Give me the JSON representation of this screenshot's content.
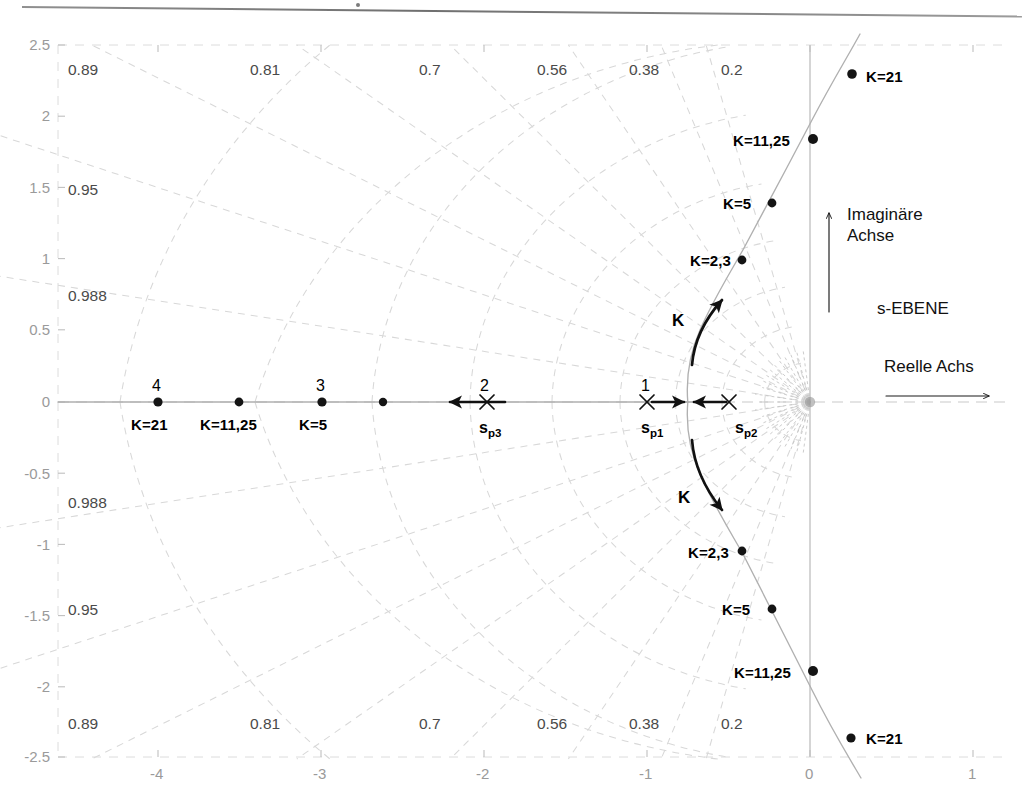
{
  "figure": {
    "title": "s-EBENE",
    "plane_label": "s-EBENE",
    "imag_axis_label_line1": "Imaginäre",
    "imag_axis_label_line2": "Achse",
    "real_axis_label": "Reelle Achs"
  },
  "axes": {
    "x_ticks": [
      "-4",
      "-3",
      "-2",
      "-1",
      "0",
      "1"
    ],
    "x_tick_values": [
      -4,
      -3,
      -2,
      -1,
      0,
      1
    ],
    "y_ticks": [
      "2.5",
      "2",
      "1.5",
      "1",
      "0.5",
      "0",
      "-0.5",
      "-1",
      "-1.5",
      "-2",
      "-2.5"
    ],
    "y_tick_values": [
      2.5,
      2,
      1.5,
      1,
      0.5,
      0,
      -0.5,
      -1,
      -1.5,
      -2,
      -2.5
    ],
    "xlim": [
      -4.85,
      1.3
    ],
    "ylim": [
      -2.5,
      2.5
    ],
    "grid": "damping-and-natural-frequency (zeta/wn polar grid, dashed)"
  },
  "damping_labels": {
    "top": [
      {
        "text": "0.89",
        "zeta": 0.89
      },
      {
        "text": "0.81",
        "zeta": 0.81
      },
      {
        "text": "0.7",
        "zeta": 0.7
      },
      {
        "text": "0.56",
        "zeta": 0.56
      },
      {
        "text": "0.38",
        "zeta": 0.38
      },
      {
        "text": "0.2",
        "zeta": 0.2
      }
    ],
    "bottom": [
      {
        "text": "0.89",
        "zeta": 0.89
      },
      {
        "text": "0.81",
        "zeta": 0.81
      },
      {
        "text": "0.7",
        "zeta": 0.7
      },
      {
        "text": "0.56",
        "zeta": 0.56
      },
      {
        "text": "0.38",
        "zeta": 0.38
      },
      {
        "text": "0.2",
        "zeta": 0.2
      }
    ],
    "left_upper": [
      {
        "text": "0.95",
        "zeta": 0.95
      },
      {
        "text": "0.988",
        "zeta": 0.988
      }
    ],
    "left_lower": [
      {
        "text": "0.988",
        "zeta": 0.988
      },
      {
        "text": "0.95",
        "zeta": 0.95
      }
    ],
    "left_top": [
      {
        "text": "0.89",
        "zeta": 0.89
      }
    ],
    "left_bottom": [
      {
        "text": "0.89",
        "zeta": 0.89
      }
    ]
  },
  "chart_data": {
    "type": "scatter",
    "title": "s-EBENE",
    "xlabel": "Reelle Achs",
    "ylabel": "Imaginäre Achse",
    "xlim": [
      -4.85,
      1.3
    ],
    "ylim": [
      -2.5,
      2.5
    ],
    "grid": true,
    "open_loop_poles": [
      {
        "name": "s_p1",
        "label": "s",
        "sub": "p1",
        "id": "1",
        "re": -1.0,
        "im": 0.0
      },
      {
        "name": "s_p2",
        "label": "s",
        "sub": "p2",
        "id": "",
        "re": -0.5,
        "im": 0.0
      },
      {
        "name": "s_p3",
        "label": "s",
        "sub": "p3",
        "id": "2",
        "re": -2.0,
        "im": 0.0
      }
    ],
    "breakaway_point": {
      "re": -0.75,
      "im": 0.0
    },
    "series": [
      {
        "name": "upper-complex-branch",
        "gain_markers": [
          {
            "K": "2,3",
            "re": -0.42,
            "im": 0.98
          },
          {
            "K": "5",
            "re": -0.24,
            "im": 1.38
          },
          {
            "K": "11,25",
            "re": 0.02,
            "im": 1.83
          },
          {
            "K": "21",
            "re": 0.26,
            "im": 2.3
          }
        ]
      },
      {
        "name": "lower-complex-branch",
        "gain_markers": [
          {
            "K": "2,3",
            "re": -0.42,
            "im": -1.06
          },
          {
            "K": "5",
            "re": -0.24,
            "im": -1.46
          },
          {
            "K": "11,25",
            "re": 0.02,
            "im": -1.89
          },
          {
            "K": "21",
            "re": 0.26,
            "im": -2.36
          }
        ]
      },
      {
        "name": "real-axis-branch",
        "gain_markers": [
          {
            "K": "5",
            "re": -3.0,
            "im": 0.0
          },
          {
            "K": "11,25",
            "re": -3.5,
            "im": 0.0
          },
          {
            "K": "21",
            "re": -4.0,
            "im": 0.0
          },
          {
            "K": "",
            "re": -2.62,
            "im": 0.0
          }
        ]
      }
    ],
    "numbered_markers": [
      {
        "id": "1",
        "re": -1.0,
        "im": 0.0
      },
      {
        "id": "2",
        "re": -2.0,
        "im": 0.0
      },
      {
        "id": "3",
        "re": -3.0,
        "im": 0.0
      },
      {
        "id": "4",
        "re": -4.0,
        "im": 0.0
      }
    ],
    "direction_arrows": [
      {
        "name": "K-up",
        "label": "K"
      },
      {
        "name": "K-down",
        "label": "K"
      },
      {
        "name": "K-left-real",
        "label": ""
      },
      {
        "name": "K-toward-breakaway-from-sp1",
        "label": ""
      },
      {
        "name": "K-toward-breakaway-from-sp2",
        "label": ""
      }
    ],
    "gain_label_prefix": "K="
  },
  "colors": {
    "locus": "#b4b4b4",
    "grid": "#d6d6d6",
    "axis": "#c9c9c9",
    "marker": "#141414",
    "arrow": "#111111",
    "tick_text": "#9a9a9a",
    "label_text": "#1a1a1a"
  }
}
